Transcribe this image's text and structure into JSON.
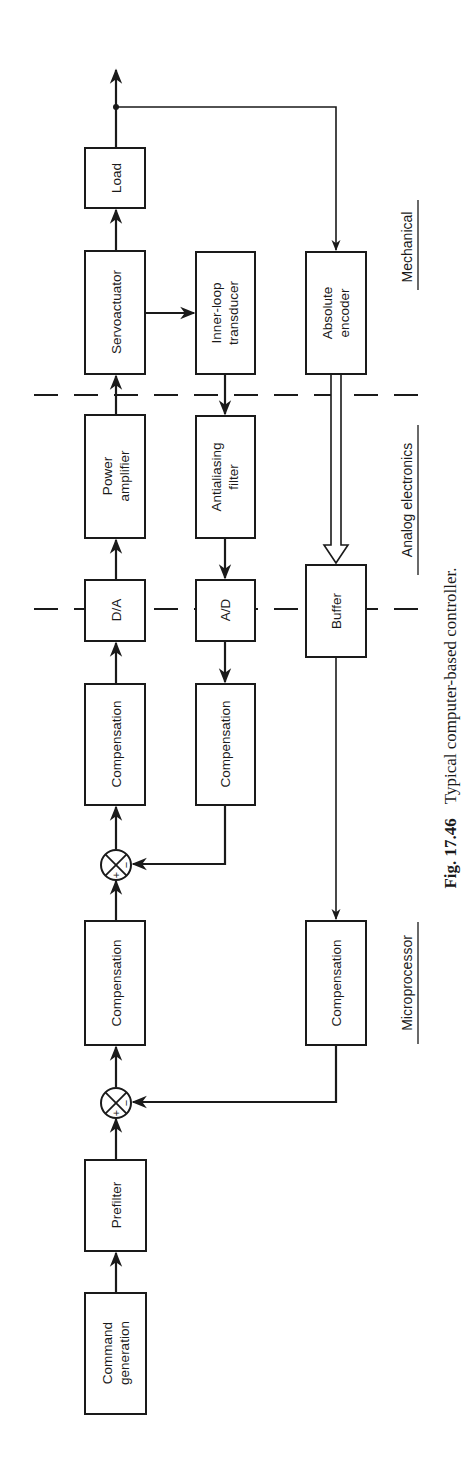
{
  "figure": {
    "caption_number": "Fig. 17.46",
    "caption_text": "Typical computer-based controller."
  },
  "sections": {
    "mechanical": "Mechanical",
    "analog": "Analog electronics",
    "microprocessor": "Microprocessor"
  },
  "blocks": {
    "load": {
      "lines": [
        "Load"
      ]
    },
    "servoactuator": {
      "lines": [
        "Servoactuator"
      ]
    },
    "power_amplifier": {
      "lines": [
        "Power",
        "amplifier"
      ]
    },
    "da": {
      "lines": [
        "D/A"
      ]
    },
    "compensation_forward_1": {
      "lines": [
        "Compensation"
      ]
    },
    "compensation_forward_2": {
      "lines": [
        "Compensation"
      ]
    },
    "prefilter": {
      "lines": [
        "Prefilter"
      ]
    },
    "command_generation": {
      "lines": [
        "Command",
        "generation"
      ]
    },
    "inner_loop_transducer": {
      "lines": [
        "Inner-loop",
        "transducer"
      ]
    },
    "antialiasing_filter": {
      "lines": [
        "Antialiasing",
        "filter"
      ]
    },
    "ad": {
      "lines": [
        "A/D"
      ]
    },
    "compensation_inner": {
      "lines": [
        "Compensation"
      ]
    },
    "absolute_encoder": {
      "lines": [
        "Absolute",
        "encoder"
      ]
    },
    "buffer": {
      "lines": [
        "Buffer"
      ]
    },
    "compensation_outer": {
      "lines": [
        "Compensation"
      ]
    }
  },
  "summing_junctions": {
    "inner": {
      "plus": "+",
      "minus": "−"
    },
    "outer": {
      "plus": "+",
      "minus": "−"
    }
  },
  "connections": [
    [
      "command_generation",
      "prefilter"
    ],
    [
      "prefilter",
      "summing_junction_outer"
    ],
    [
      "summing_junction_outer",
      "compensation_forward_2"
    ],
    [
      "compensation_forward_2",
      "summing_junction_inner"
    ],
    [
      "summing_junction_inner",
      "compensation_forward_1"
    ],
    [
      "compensation_forward_1",
      "da"
    ],
    [
      "da",
      "power_amplifier"
    ],
    [
      "power_amplifier",
      "servoactuator"
    ],
    [
      "servoactuator",
      "load"
    ],
    [
      "load",
      "output"
    ],
    [
      "servoactuator",
      "inner_loop_transducer"
    ],
    [
      "inner_loop_transducer",
      "antialiasing_filter"
    ],
    [
      "antialiasing_filter",
      "ad"
    ],
    [
      "ad",
      "compensation_inner"
    ],
    [
      "compensation_inner",
      "summing_junction_inner"
    ],
    [
      "output",
      "absolute_encoder"
    ],
    [
      "absolute_encoder",
      "buffer"
    ],
    [
      "buffer",
      "compensation_outer"
    ],
    [
      "compensation_outer",
      "summing_junction_outer"
    ]
  ]
}
